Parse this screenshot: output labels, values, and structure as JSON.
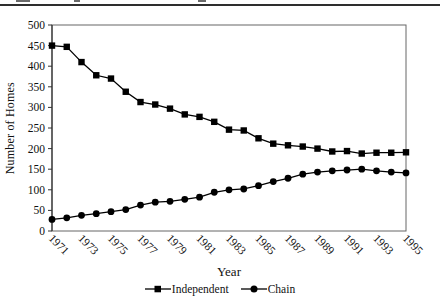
{
  "chart_data": {
    "type": "line",
    "title": "",
    "xlabel": "Year",
    "ylabel": "Number of Homes",
    "x": [
      1971,
      1972,
      1973,
      1974,
      1975,
      1976,
      1977,
      1978,
      1979,
      1980,
      1981,
      1982,
      1983,
      1984,
      1985,
      1986,
      1987,
      1988,
      1989,
      1990,
      1991,
      1992,
      1993,
      1994,
      1995
    ],
    "x_tick_labels": [
      "1971",
      "1973",
      "1975",
      "1977",
      "1979",
      "1981",
      "1983",
      "1985",
      "1987",
      "1989",
      "1991",
      "1993",
      "1995"
    ],
    "y_ticks": [
      0,
      50,
      100,
      150,
      200,
      250,
      300,
      350,
      400,
      450,
      500
    ],
    "ylim": [
      0,
      500
    ],
    "grid": false,
    "legend_position": "bottom",
    "line_color": "#000000",
    "axis_color": "#666666",
    "series": [
      {
        "name": "Independent",
        "marker": "square",
        "values": [
          450,
          447,
          410,
          378,
          370,
          338,
          313,
          307,
          297,
          283,
          277,
          265,
          246,
          244,
          225,
          212,
          208,
          205,
          200,
          193,
          194,
          188,
          190,
          190,
          191
        ]
      },
      {
        "name": "Chain",
        "marker": "circle",
        "values": [
          28,
          32,
          38,
          42,
          47,
          52,
          63,
          70,
          72,
          77,
          82,
          94,
          100,
          102,
          110,
          120,
          128,
          138,
          143,
          146,
          148,
          150,
          146,
          143,
          141
        ]
      }
    ]
  }
}
